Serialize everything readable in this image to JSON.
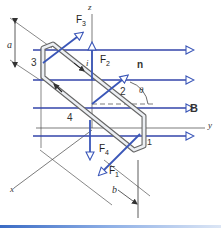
{
  "diagram": {
    "type": "physics-torque-on-current-loop",
    "axes": {
      "x": "x",
      "y": "y",
      "z": "z"
    },
    "field_label": "B",
    "normal_label": "n",
    "angle_label": "θ",
    "current_label": "i",
    "dimension_a": "a",
    "dimension_b": "b",
    "sides": [
      "1",
      "2",
      "3",
      "4"
    ],
    "forces": [
      {
        "name": "F",
        "sub": "1"
      },
      {
        "name": "F",
        "sub": "2"
      },
      {
        "name": "F",
        "sub": "3"
      },
      {
        "name": "F",
        "sub": "4"
      }
    ],
    "colors": {
      "field_lines": "#3344aa",
      "force_arrows": "#3a56b8",
      "loop": "#555555",
      "axes": "#444444",
      "accent_bar": "#3a6bc4"
    }
  }
}
